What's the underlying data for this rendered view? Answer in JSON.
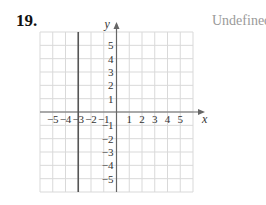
{
  "problem": {
    "number": "19.",
    "answer": "Undefined"
  },
  "colors": {
    "grid": "#d9d9d9",
    "axis": "#666666",
    "line": "#555555",
    "answer_text": "#9a9a9a"
  },
  "chart_data": {
    "type": "line",
    "title": "",
    "xlabel": "x",
    "ylabel": "y",
    "xlim": [
      -6,
      6
    ],
    "ylim": [
      -6,
      6
    ],
    "grid": true,
    "x_ticks": [
      -5,
      -4,
      -3,
      -2,
      -1,
      1,
      2,
      3,
      4,
      5
    ],
    "y_ticks": [
      -5,
      -4,
      -3,
      -2,
      -1,
      1,
      2,
      3,
      4,
      5
    ],
    "x_tick_labels": [
      "−5",
      "−4",
      "−3",
      "−2",
      "−1",
      "1",
      "2",
      "3",
      "4",
      "5"
    ],
    "y_tick_labels": [
      "−5",
      "−4",
      "−3",
      "−2",
      "−1",
      "1",
      "2",
      "3",
      "4",
      "5"
    ],
    "series": [
      {
        "name": "x = -3",
        "equation": "x = -3",
        "x": [
          -3,
          -3
        ],
        "y": [
          -6,
          6
        ],
        "slope": "Undefined"
      }
    ]
  }
}
